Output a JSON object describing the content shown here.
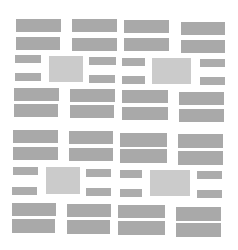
{
  "canvas": {
    "width": 238,
    "height": 250,
    "background": "#ffffff"
  },
  "colors": {
    "bar": "#a9a9a9",
    "small_bar": "#acacac",
    "square": "#cbcbcb"
  },
  "blocks": [
    {
      "t": "bar",
      "x": 16,
      "y": 19,
      "w": 45,
      "h": 13
    },
    {
      "t": "bar",
      "x": 72,
      "y": 19,
      "w": 45,
      "h": 13
    },
    {
      "t": "bar",
      "x": 16,
      "y": 37,
      "w": 44,
      "h": 13
    },
    {
      "t": "bar",
      "x": 72,
      "y": 38,
      "w": 45,
      "h": 13
    },
    {
      "t": "sbar",
      "x": 15,
      "y": 55,
      "w": 26,
      "h": 8
    },
    {
      "t": "sq",
      "x": 49,
      "y": 56,
      "w": 34,
      "h": 26
    },
    {
      "t": "sbar",
      "x": 89,
      "y": 57,
      "w": 27,
      "h": 8
    },
    {
      "t": "sbar",
      "x": 15,
      "y": 73,
      "w": 26,
      "h": 8
    },
    {
      "t": "sbar",
      "x": 89,
      "y": 75,
      "w": 26,
      "h": 8
    },
    {
      "t": "bar",
      "x": 14,
      "y": 88,
      "w": 45,
      "h": 13
    },
    {
      "t": "bar",
      "x": 70,
      "y": 89,
      "w": 45,
      "h": 13
    },
    {
      "t": "bar",
      "x": 14,
      "y": 104,
      "w": 44,
      "h": 13
    },
    {
      "t": "bar",
      "x": 70,
      "y": 105,
      "w": 44,
      "h": 13
    },
    {
      "t": "bar",
      "x": 124,
      "y": 20,
      "w": 45,
      "h": 13
    },
    {
      "t": "bar",
      "x": 181,
      "y": 22,
      "w": 44,
      "h": 13
    },
    {
      "t": "bar",
      "x": 124,
      "y": 38,
      "w": 45,
      "h": 13
    },
    {
      "t": "bar",
      "x": 181,
      "y": 40,
      "w": 44,
      "h": 13
    },
    {
      "t": "sbar",
      "x": 122,
      "y": 58,
      "w": 23,
      "h": 8
    },
    {
      "t": "sq",
      "x": 152,
      "y": 58,
      "w": 39,
      "h": 26
    },
    {
      "t": "sbar",
      "x": 200,
      "y": 59,
      "w": 25,
      "h": 8
    },
    {
      "t": "sbar",
      "x": 122,
      "y": 76,
      "w": 23,
      "h": 8
    },
    {
      "t": "sbar",
      "x": 200,
      "y": 77,
      "w": 25,
      "h": 8
    },
    {
      "t": "bar",
      "x": 122,
      "y": 90,
      "w": 46,
      "h": 13
    },
    {
      "t": "bar",
      "x": 179,
      "y": 92,
      "w": 45,
      "h": 13
    },
    {
      "t": "bar",
      "x": 122,
      "y": 107,
      "w": 46,
      "h": 13
    },
    {
      "t": "bar",
      "x": 179,
      "y": 109,
      "w": 45,
      "h": 13
    },
    {
      "t": "bar",
      "x": 13,
      "y": 130,
      "w": 45,
      "h": 13
    },
    {
      "t": "bar",
      "x": 69,
      "y": 131,
      "w": 44,
      "h": 13
    },
    {
      "t": "bar",
      "x": 13,
      "y": 147,
      "w": 45,
      "h": 13
    },
    {
      "t": "bar",
      "x": 69,
      "y": 148,
      "w": 44,
      "h": 13
    },
    {
      "t": "sbar",
      "x": 13,
      "y": 167,
      "w": 25,
      "h": 8
    },
    {
      "t": "sq",
      "x": 46,
      "y": 167,
      "w": 34,
      "h": 27
    },
    {
      "t": "sbar",
      "x": 86,
      "y": 169,
      "w": 25,
      "h": 8
    },
    {
      "t": "sbar",
      "x": 12,
      "y": 187,
      "w": 25,
      "h": 8
    },
    {
      "t": "sbar",
      "x": 86,
      "y": 188,
      "w": 25,
      "h": 8
    },
    {
      "t": "bar",
      "x": 12,
      "y": 203,
      "w": 44,
      "h": 13
    },
    {
      "t": "bar",
      "x": 67,
      "y": 204,
      "w": 44,
      "h": 13
    },
    {
      "t": "bar",
      "x": 12,
      "y": 219,
      "w": 43,
      "h": 14
    },
    {
      "t": "bar",
      "x": 67,
      "y": 220,
      "w": 43,
      "h": 14
    },
    {
      "t": "bar",
      "x": 120,
      "y": 133,
      "w": 47,
      "h": 14
    },
    {
      "t": "bar",
      "x": 178,
      "y": 134,
      "w": 45,
      "h": 14
    },
    {
      "t": "bar",
      "x": 120,
      "y": 149,
      "w": 47,
      "h": 14
    },
    {
      "t": "bar",
      "x": 178,
      "y": 151,
      "w": 45,
      "h": 14
    },
    {
      "t": "sbar",
      "x": 120,
      "y": 170,
      "w": 22,
      "h": 8
    },
    {
      "t": "sq",
      "x": 150,
      "y": 170,
      "w": 40,
      "h": 26
    },
    {
      "t": "sbar",
      "x": 197,
      "y": 171,
      "w": 25,
      "h": 8
    },
    {
      "t": "sbar",
      "x": 120,
      "y": 189,
      "w": 22,
      "h": 8
    },
    {
      "t": "sbar",
      "x": 197,
      "y": 190,
      "w": 25,
      "h": 8
    },
    {
      "t": "bar",
      "x": 118,
      "y": 205,
      "w": 47,
      "h": 13
    },
    {
      "t": "bar",
      "x": 176,
      "y": 207,
      "w": 45,
      "h": 14
    },
    {
      "t": "bar",
      "x": 118,
      "y": 221,
      "w": 47,
      "h": 14
    },
    {
      "t": "bar",
      "x": 176,
      "y": 223,
      "w": 45,
      "h": 14
    }
  ]
}
